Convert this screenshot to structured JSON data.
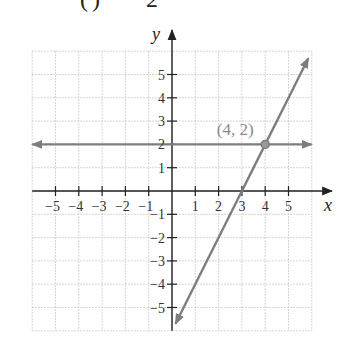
{
  "clipped_header": {
    "paren_text": "(",
    "paren_close": ")",
    "rhs_text": "2"
  },
  "chart_data": {
    "type": "line",
    "title": "",
    "xlabel": "x",
    "ylabel": "y",
    "xlim": [
      -6,
      6
    ],
    "ylim": [
      -6,
      6
    ],
    "grid": true,
    "x_ticks": [
      -5,
      -4,
      -3,
      -2,
      -1,
      1,
      2,
      3,
      4,
      5
    ],
    "y_ticks": [
      -5,
      -4,
      -3,
      -2,
      -1,
      1,
      2,
      3,
      4,
      5
    ],
    "x_tick_labels": [
      "−5",
      "−4",
      "−3",
      "−2",
      "−1",
      "1",
      "2",
      "3",
      "4",
      "5"
    ],
    "y_tick_labels": [
      "−5",
      "−4",
      "−3",
      "−2",
      "−1",
      "1",
      "2",
      "3",
      "4",
      "5"
    ],
    "series": [
      {
        "name": "y = 2",
        "kind": "horizontal line",
        "points": [
          [
            -6,
            2
          ],
          [
            6,
            2
          ]
        ],
        "arrows": "both"
      },
      {
        "name": "y = 2x − 6",
        "kind": "line",
        "points": [
          [
            0.15,
            -5.7
          ],
          [
            5.85,
            5.7
          ]
        ],
        "arrows": "both"
      }
    ],
    "annotations": [
      {
        "label": "(4, 2)",
        "x": 4,
        "y": 2,
        "marker": "circle"
      }
    ],
    "colors": {
      "axes": "#222222",
      "lines": "#7d7d7d",
      "grid": "#c8c8c8",
      "point_label": "#8a8a8a"
    }
  }
}
